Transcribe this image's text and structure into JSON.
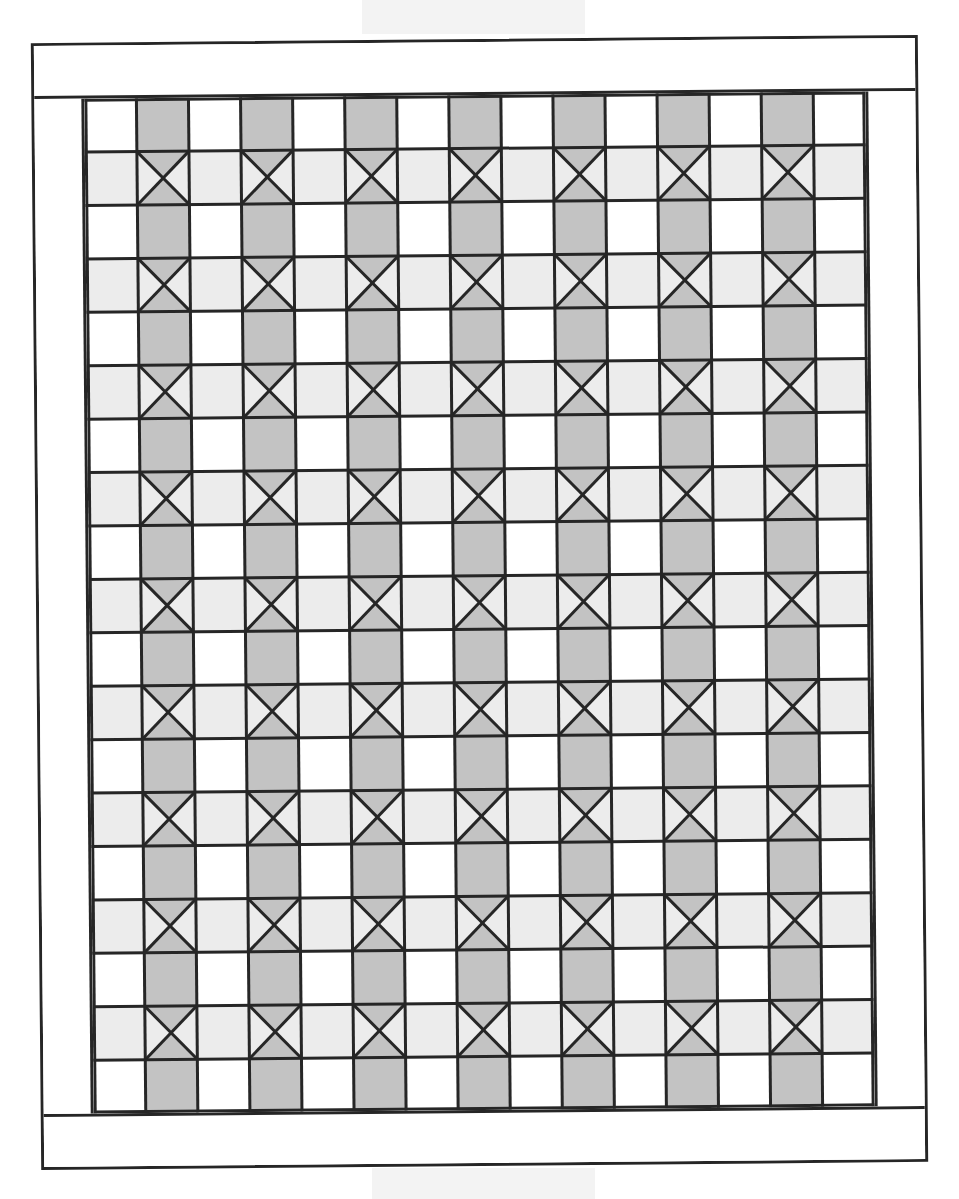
{
  "figure": {
    "type": "quilt-layout-diagram",
    "description": "Quilt top layout: pieced center of alternating sashing columns and hourglass (X) blocks, surrounded by plain borders",
    "grid": {
      "columns": 15,
      "rows": 19,
      "column_pattern": [
        "plain",
        "sash",
        "plain",
        "sash",
        "plain",
        "sash",
        "plain",
        "sash",
        "plain",
        "sash",
        "plain",
        "sash",
        "plain",
        "sash",
        "plain"
      ],
      "row_pattern": [
        "strip-row",
        "hourglass-row",
        "strip-row",
        "hourglass-row",
        "strip-row",
        "hourglass-row",
        "strip-row",
        "hourglass-row",
        "strip-row",
        "hourglass-row",
        "strip-row",
        "hourglass-row",
        "strip-row",
        "hourglass-row",
        "strip-row",
        "hourglass-row",
        "strip-row",
        "hourglass-row",
        "strip-row"
      ],
      "sash_columns_count": 7,
      "hourglass_blocks_count": 63,
      "sash_rectangles_count": 70
    },
    "borders": [
      "top",
      "right",
      "bottom",
      "left"
    ],
    "colors": {
      "line": "#262626",
      "dark_fill": "#c3c3c3",
      "light_fill": "#ececec",
      "plain_fill": "#ffffff",
      "background": "#ffffff",
      "bleed_through": "#f1f1f1"
    }
  }
}
